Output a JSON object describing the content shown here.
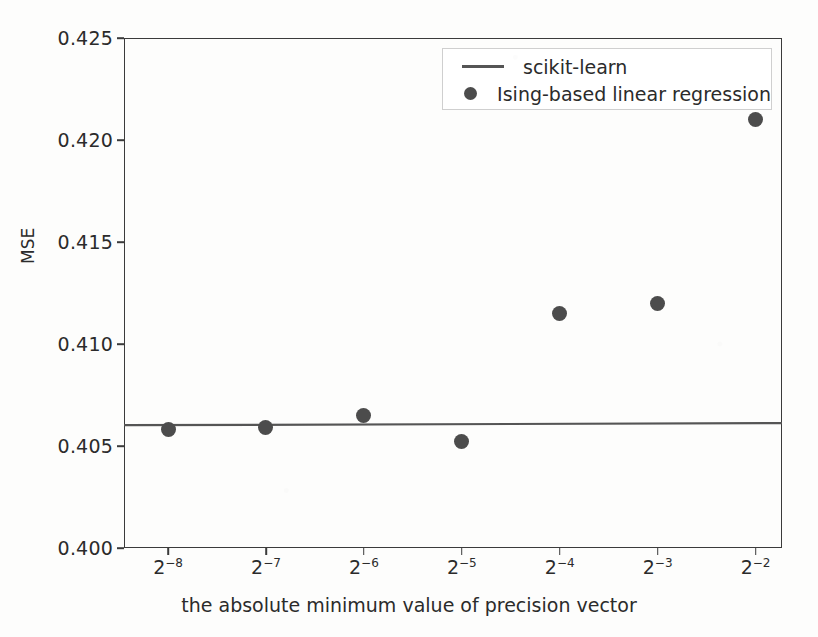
{
  "chart_data": {
    "type": "scatter",
    "title": "",
    "xlabel": "the absolute minimum value of precision vector",
    "ylabel": "MSE",
    "xtick_labels": [
      "2−8",
      "2−7",
      "2−6",
      "2−5",
      "2−4",
      "2−3",
      "2−2"
    ],
    "xtick_bases": [
      "2",
      "2",
      "2",
      "2",
      "2",
      "2",
      "2"
    ],
    "xtick_exponents": [
      "−8",
      "−7",
      "−6",
      "−5",
      "−4",
      "−3",
      "−2"
    ],
    "categories": [
      -8,
      -7,
      -6,
      -5,
      -4,
      -3,
      -2
    ],
    "ytick_labels": [
      "0.400",
      "0.405",
      "0.410",
      "0.415",
      "0.420",
      "0.425"
    ],
    "yticks": [
      0.4,
      0.405,
      0.41,
      0.415,
      0.42,
      0.425
    ],
    "ylim": [
      0.4,
      0.425
    ],
    "xlim": [
      -8.45,
      -1.73
    ],
    "grid": false,
    "legend_position": "upper right",
    "series": [
      {
        "name": "scikit-learn",
        "style": "line",
        "color": "#555555",
        "x": [
          -8.45,
          -1.73
        ],
        "values": [
          0.40602,
          0.40612
        ]
      },
      {
        "name": "Ising-based linear regression",
        "style": "marker",
        "color": "#4c4c4c",
        "x": [
          -8,
          -7,
          -6,
          -5,
          -4,
          -3,
          -2
        ],
        "values": [
          0.4058,
          0.4059,
          0.4065,
          0.4052,
          0.4115,
          0.412,
          0.421
        ]
      }
    ]
  },
  "legend": {
    "entries": [
      {
        "label": "scikit-learn",
        "marker": "line"
      },
      {
        "label": "Ising-based linear regression",
        "marker": "dot"
      }
    ]
  }
}
